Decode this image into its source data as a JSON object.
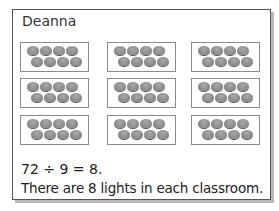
{
  "card": {
    "name": "Deanna",
    "groups": 9,
    "lights_per_group": 8,
    "equation": "72 ÷ 9 = 8.",
    "answer": "There are 8 lights in each classroom."
  }
}
